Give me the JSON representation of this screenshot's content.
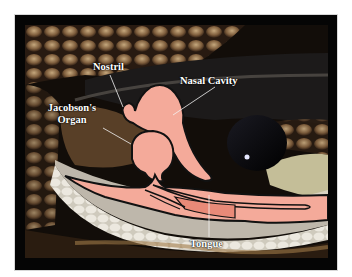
{
  "diagram": {
    "labels": {
      "nostril": "Nostril",
      "nasal_cavity": "Nasal Cavity",
      "jacobsons_organ_line1": "Jacobson's",
      "jacobsons_organ_line2": "Organ",
      "tongue": "Tongue"
    },
    "colors": {
      "border": "#050505",
      "background": "#ffffff",
      "anatomy_fill": "#f4aa9a",
      "tongue_dark_fill": "#e98a78",
      "outline": "#111111",
      "label_text": "#ffffff",
      "leader_line": "#f2f2f2"
    }
  }
}
